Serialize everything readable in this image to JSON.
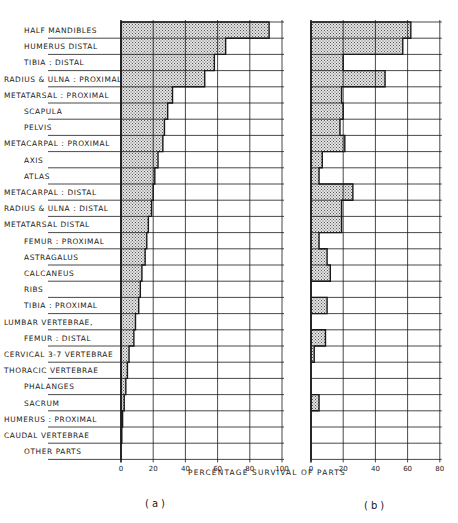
{
  "chart_data": [
    {
      "panel": "(a)",
      "type": "bar",
      "orientation": "horizontal",
      "style": "stepped cumulative profile, stippled fill",
      "xlabel": "PERCENTAGE SURVIVAL OF PARTS",
      "xlim": [
        0,
        100
      ],
      "xticks": [
        0,
        20,
        40,
        60,
        80,
        100
      ],
      "grid": true,
      "categories": [
        "HALF MANDIBLES",
        "HUMERUS DISTAL",
        "TIBIA : DISTAL",
        "RADIUS & ULNA : PROXIMAL",
        "METATARSAL : PROXIMAL",
        "SCAPULA",
        "PELVIS",
        "METACARPAL : PROXIMAL",
        "AXIS",
        "ATLAS",
        "METACARPAL : DISTAL",
        "RADIUS & ULNA : DISTAL",
        "METATARSAL DISTAL",
        "FEMUR : PROXIMAL",
        "ASTRAGALUS",
        "CALCANEUS",
        "RIBS",
        "TIBIA : PROXIMAL",
        "LUMBAR VERTEBRAE,",
        "FEMUR : DISTAL",
        "CERVICAL 3-7 VERTEBRAE",
        "THORACIC VERTEBRAE",
        "PHALANGES",
        "SACRUM",
        "HUMERUS : PROXIMAL",
        "CAUDAL VERTEBRAE",
        "OTHER PARTS"
      ],
      "values": [
        92,
        65,
        58,
        52,
        32,
        29,
        27,
        26,
        23,
        21,
        20,
        19,
        17,
        16,
        15,
        13,
        12,
        11,
        9,
        8,
        5,
        4,
        3,
        2,
        1,
        0.5,
        0
      ]
    },
    {
      "panel": "(b)",
      "type": "bar",
      "orientation": "horizontal",
      "style": "stepped profile, stippled fill",
      "xlabel": "PERCENTAGE SURVIVAL OF PARTS",
      "xlim": [
        0,
        80
      ],
      "xticks": [
        0,
        20,
        40,
        60,
        80
      ],
      "grid": true,
      "categories": [
        "HALF MANDIBLES",
        "HUMERUS DISTAL",
        "TIBIA : DISTAL",
        "RADIUS & ULNA : PROXIMAL",
        "METATARSAL : PROXIMAL",
        "SCAPULA",
        "PELVIS",
        "METACARPAL : PROXIMAL",
        "AXIS",
        "ATLAS",
        "METACARPAL : DISTAL",
        "RADIUS & ULNA : DISTAL",
        "METATARSAL DISTAL",
        "FEMUR : PROXIMAL",
        "ASTRAGALUS",
        "CALCANEUS",
        "RIBS",
        "TIBIA : PROXIMAL",
        "LUMBAR VERTEBRAE,",
        "FEMUR : DISTAL",
        "CERVICAL 3-7 VERTEBRAE",
        "THORACIC VERTEBRAE",
        "PHALANGES",
        "SACRUM",
        "HUMERUS : PROXIMAL",
        "CAUDAL VERTEBRAE",
        "OTHER PARTS"
      ],
      "values": [
        62,
        57,
        20,
        46,
        19,
        20,
        18,
        21,
        7,
        5,
        26,
        19,
        19,
        5,
        10,
        12,
        0,
        10,
        0,
        9,
        2,
        0,
        0,
        5,
        0,
        0,
        0
      ]
    }
  ],
  "labels": {
    "rows": [
      "HALF  MANDIBLES",
      "HUMERUS  DISTAL",
      "TIBIA : DISTAL",
      "RADIUS & ULNA : PROXIMAL",
      "METATARSAL : PROXIMAL",
      "SCAPULA",
      "PELVIS",
      "METACARPAL : PROXIMAL",
      "AXIS",
      "ATLAS",
      "METACARPAL : DISTAL",
      "RADIUS & ULNA : DISTAL",
      "METATARSAL  DISTAL",
      "FEMUR : PROXIMAL",
      "ASTRAGALUS",
      "CALCANEUS",
      "RIBS",
      "TIBIA : PROXIMAL",
      "LUMBAR  VERTEBRAE,",
      "FEMUR : DISTAL",
      "CERVICAL  3-7  VERTEBRAE",
      "THORACIC  VERTEBRAE",
      "PHALANGES",
      "SACRUM",
      "HUMERUS : PROXIMAL",
      "CAUDAL  VERTEBRAE",
      "OTHER  PARTS"
    ],
    "indent": [
      1,
      1,
      1,
      0,
      0,
      1,
      1,
      0,
      1,
      1,
      0,
      0,
      0,
      1,
      1,
      1,
      1,
      1,
      0,
      1,
      0,
      0,
      1,
      1,
      0,
      0,
      1
    ],
    "x_title": "PERCENTAGE  SURVIVAL  OF  PARTS",
    "caption_a": "(a)",
    "caption_b": "(b)",
    "ticks_a": [
      "0",
      "20",
      "40",
      "60",
      "80",
      "100"
    ],
    "ticks_b": [
      "0",
      "20",
      "40",
      "60",
      "80"
    ]
  },
  "colors": {
    "ink": "#1a1a1a",
    "fill": "#bdbdbd",
    "background": "#ffffff"
  }
}
